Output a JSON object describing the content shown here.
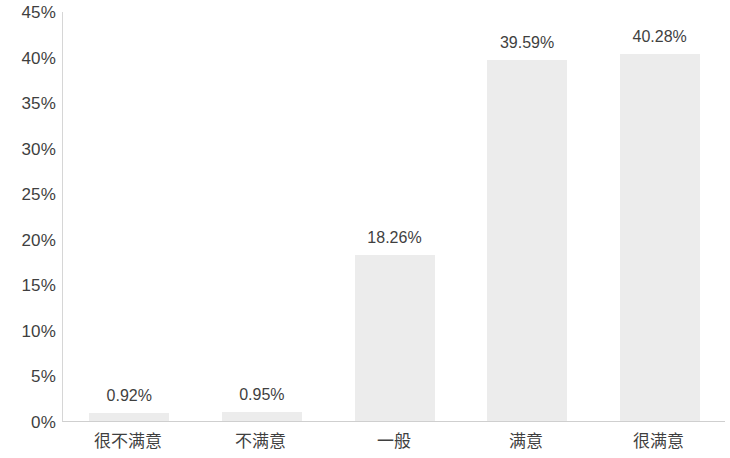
{
  "chart_data": {
    "type": "bar",
    "title": "",
    "subtitle": "",
    "xlabel": "",
    "ylabel": "",
    "categories": [
      "很不满意",
      "不满意",
      "一般",
      "满意",
      "很满意"
    ],
    "values": [
      0.92,
      0.95,
      18.26,
      39.59,
      40.28
    ],
    "data_labels": [
      "0.92%",
      "0.95%",
      "18.26%",
      "39.59%",
      "40.28%"
    ],
    "ylim": [
      0,
      45
    ],
    "ytick_values": [
      0,
      5,
      10,
      15,
      20,
      25,
      30,
      35,
      40,
      45
    ],
    "ytick_labels": [
      "0%",
      "5%",
      "10%",
      "15%",
      "20%",
      "25%",
      "30%",
      "35%",
      "40%",
      "45%"
    ],
    "grid": false,
    "legend": null,
    "legend_position": "none",
    "series": [
      {
        "name": "",
        "values": [
          0.92,
          0.95,
          18.26,
          39.59,
          40.28
        ]
      }
    ],
    "colors": {
      "bar_fill": "#ececec",
      "axis_line": "#d3d3d3",
      "text": "#3f3f3f",
      "background": "#ffffff"
    }
  }
}
